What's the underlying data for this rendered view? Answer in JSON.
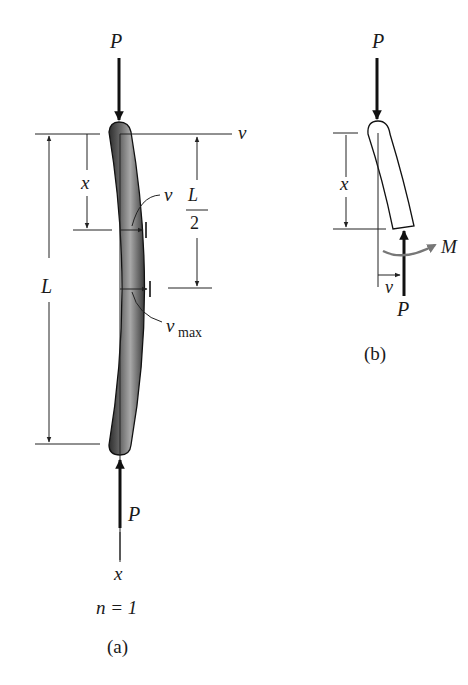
{
  "figure_a": {
    "caption": "(a)",
    "load_top": "P",
    "load_bottom": "P",
    "axis_v": "v",
    "axis_x": "x",
    "dim_x": "x",
    "dim_L": "L",
    "dim_half_num": "L",
    "dim_half_den": "2",
    "deflection": "v",
    "deflection_max_main": "v",
    "deflection_max_sub": "max",
    "mode": "n = 1"
  },
  "figure_b": {
    "caption": "(b)",
    "load_top": "P",
    "load_bottom": "P",
    "dim_x": "x",
    "deflection": "v",
    "moment": "M"
  },
  "colors": {
    "column_fill_dark": "#3a3a3a",
    "column_fill_light": "#9a9a9a",
    "moment_arrow": "#777777",
    "line": "#222222"
  }
}
